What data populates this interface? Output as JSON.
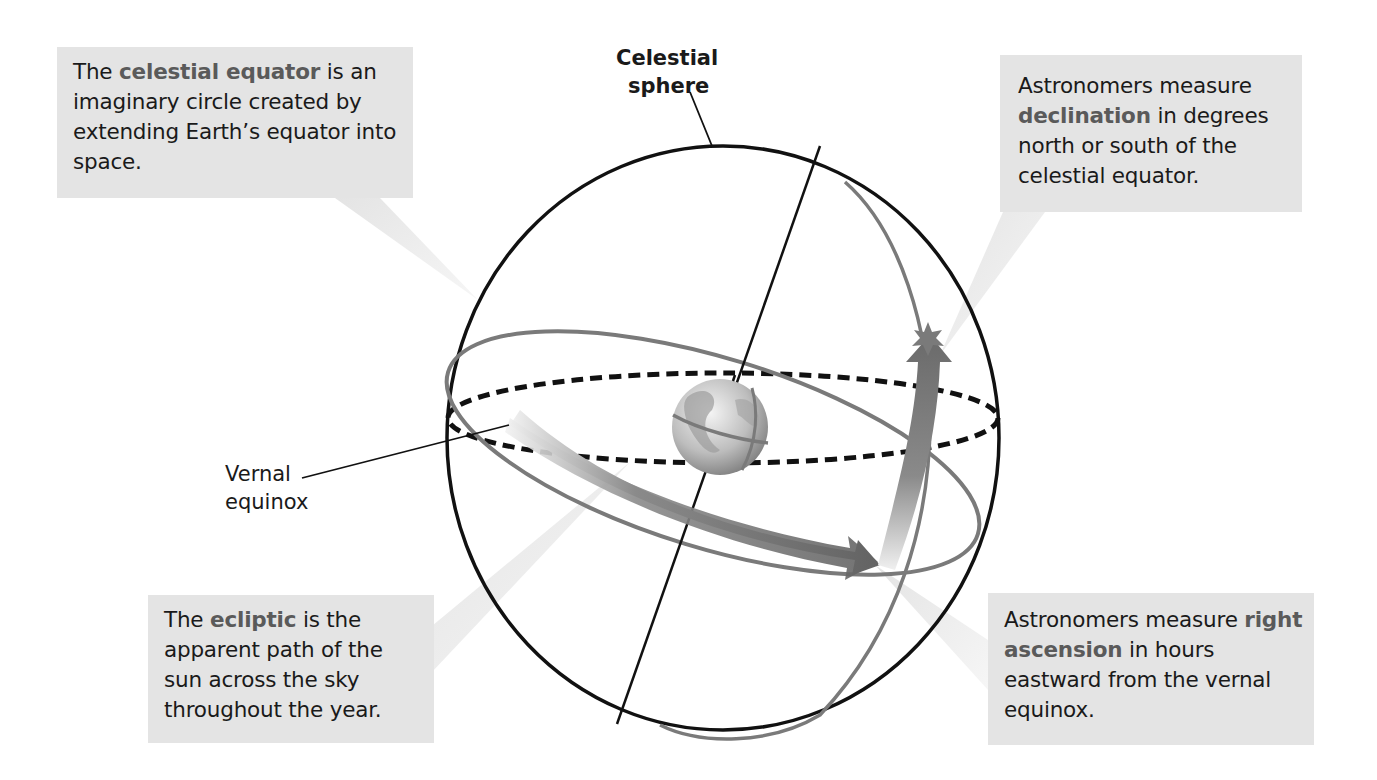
{
  "diagram": {
    "labels": {
      "celestial_sphere_line1": "Celestial",
      "celestial_sphere_line2": "sphere",
      "vernal_equinox_line1": "Vernal",
      "vernal_equinox_line2": "equinox"
    },
    "callouts": {
      "celestial_equator": {
        "pre": "The ",
        "keyword": "celestial equator",
        "post": " is an imaginary circle created by extending Earth’s equator into space."
      },
      "declination": {
        "pre": "Astronomers measure ",
        "keyword": "declination",
        "post": " in degrees north or south of the celestial equator."
      },
      "ecliptic": {
        "pre": "The ",
        "keyword": "ecliptic",
        "post": " is the apparent path of the sun across the sky throughout the year."
      },
      "right_ascension": {
        "pre": "Astronomers measure ",
        "keyword": "right ascension",
        "post": " in hours eastward from the vernal equinox."
      }
    },
    "colors": {
      "callout_bg": "#e4e4e4",
      "keyword": "#5a5a5a",
      "sphere_outline": "#111111",
      "ecliptic": "#7a7a7a",
      "equator_dashed": "#111111",
      "arrow": "#6e6e6e"
    }
  }
}
